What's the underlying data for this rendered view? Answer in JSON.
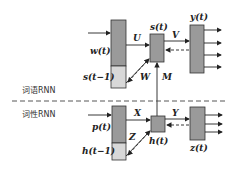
{
  "sections": {
    "word_rnn": "词语RNN",
    "pos_rnn": "词性RNN"
  },
  "word_rnn": {
    "input_label": "w(t)",
    "context_label": "s(t−1)",
    "hidden_label": "s(t)",
    "output_label": "y(t)",
    "weight_input": "U",
    "weight_recurrent": "W",
    "weight_output": "V"
  },
  "pos_rnn": {
    "input_label": "p(t)",
    "context_label": "h(t−1)",
    "hidden_label": "h(t)",
    "output_label": "z(t)",
    "weight_input": "X",
    "weight_recurrent": "Z",
    "weight_output": "Y"
  },
  "cross_weight": "M",
  "colors": {
    "dark_box": "#9a9a9a",
    "light_box": "#d8d8d8",
    "stroke": "#333333"
  }
}
